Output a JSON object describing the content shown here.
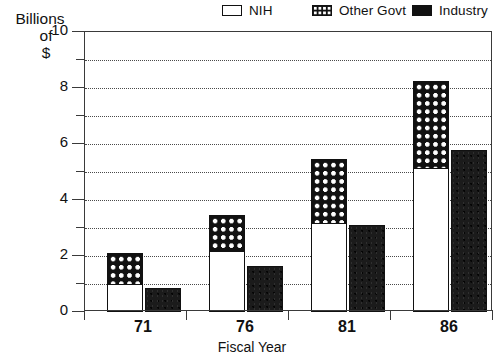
{
  "chart_data": {
    "type": "bar",
    "subtype": "grouped-stacked",
    "title": "",
    "xlabel": "Fiscal Year",
    "ylabel": "Billions of $",
    "ylabel_lines": [
      "Billions",
      "of",
      "$"
    ],
    "categories": [
      "71",
      "76",
      "81",
      "86"
    ],
    "ylim": [
      0,
      10
    ],
    "yticks": [
      0,
      2,
      4,
      6,
      8,
      10
    ],
    "ytick_labels": [
      "0",
      "2",
      "4",
      "6",
      "8",
      "10"
    ],
    "yminorticks": [
      1,
      3,
      5,
      7,
      9
    ],
    "grid": true,
    "grid_style": "dotted",
    "grid_interval": 1,
    "legend_position": "top",
    "series": [
      {
        "name": "NIH",
        "pattern": "open",
        "color": "#ffffff",
        "stack": "government",
        "values": [
          1.0,
          2.2,
          3.2,
          5.15
        ]
      },
      {
        "name": "Other Govt",
        "pattern": "checker",
        "color": "#111111",
        "stack": "government",
        "values": [
          1.1,
          1.25,
          2.25,
          3.1
        ]
      },
      {
        "name": "Industry",
        "pattern": "solid",
        "color": "#111111",
        "stack": "industry",
        "values": [
          0.85,
          1.65,
          3.1,
          5.8
        ]
      }
    ],
    "stack_totals": {
      "government": [
        2.1,
        3.45,
        5.45,
        8.25
      ],
      "industry": [
        0.85,
        1.65,
        3.1,
        5.8
      ]
    }
  },
  "legend": {
    "items": [
      {
        "label": "NIH",
        "swatch": "legend-swatch-open"
      },
      {
        "label": "Other Govt",
        "swatch": "legend-swatch-checker"
      },
      {
        "label": "Industry",
        "swatch": "legend-swatch-solid"
      }
    ]
  },
  "axes": {
    "y_title_lines": [
      "Billions",
      "of",
      "$"
    ],
    "x_title": "Fiscal Year",
    "y_tick_labels": [
      "10",
      "8",
      "6",
      "4",
      "2",
      "0"
    ],
    "x_tick_labels": [
      "71",
      "76",
      "81",
      "86"
    ]
  },
  "colors": {
    "ink": "#111111",
    "frame": "#3a3a3a",
    "grid": "#4a4a4a",
    "background": "#ffffff"
  }
}
